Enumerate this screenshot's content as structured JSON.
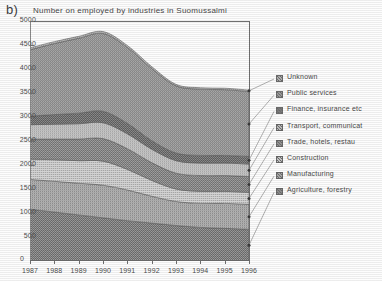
{
  "panel": {
    "label": "b)"
  },
  "chart_data": {
    "type": "area",
    "stacked": true,
    "title": "Number on employed by industries in Suomussalmi",
    "xlabel": "",
    "ylabel": "",
    "x": [
      1987,
      1988,
      1989,
      1990,
      1991,
      1992,
      1993,
      1994,
      1995,
      1996
    ],
    "categories": [
      "1987",
      "1988",
      "1989",
      "1990",
      "1991",
      "1992",
      "1993",
      "1994",
      "1995",
      "1996"
    ],
    "xlim": [
      1987,
      1996
    ],
    "ylim": [
      0,
      5000
    ],
    "yticks": [
      0,
      500,
      1000,
      1500,
      2000,
      2500,
      3000,
      3500,
      4000,
      4500,
      5000
    ],
    "ytick_labels": [
      "0",
      "500",
      "1000",
      "1500",
      "2000",
      "2500",
      "3000",
      "3500",
      "4000",
      "4500",
      "5000"
    ],
    "grid": false,
    "legend_position": "right",
    "series": [
      {
        "name": "Agriculture, forestry",
        "color": "#8e8e8e",
        "values": [
          1080,
          1020,
          960,
          900,
          840,
          790,
          740,
          700,
          680,
          660
        ]
      },
      {
        "name": "Manufacturing",
        "color": "#a8a8a8",
        "values": [
          620,
          640,
          660,
          680,
          640,
          560,
          500,
          500,
          520,
          520
        ]
      },
      {
        "name": "Construction",
        "color": "#c6c6c6",
        "values": [
          420,
          450,
          470,
          500,
          430,
          330,
          260,
          250,
          250,
          250
        ]
      },
      {
        "name": "Trade, hotels, restau",
        "color": "#959595",
        "values": [
          420,
          430,
          450,
          470,
          430,
          370,
          330,
          330,
          330,
          330
        ]
      },
      {
        "name": "Transport, communicat",
        "color": "#bdbdbd",
        "values": [
          300,
          310,
          320,
          330,
          310,
          280,
          260,
          260,
          260,
          260
        ]
      },
      {
        "name": "Finance, insurance etc",
        "color": "#7d7d7d",
        "values": [
          180,
          200,
          220,
          240,
          220,
          180,
          160,
          160,
          160,
          160
        ]
      },
      {
        "name": "Public services",
        "color": "#9c9c9c",
        "values": [
          1380,
          1480,
          1560,
          1620,
          1580,
          1500,
          1400,
          1380,
          1370,
          1350
        ]
      },
      {
        "name": "Unknown",
        "color": "#b2b2b2",
        "values": [
          40,
          40,
          40,
          40,
          40,
          40,
          30,
          30,
          30,
          30
        ]
      }
    ],
    "legend_entries": [
      "Unknown",
      "Public services",
      "Finance, insurance etc",
      "Transport, communicat",
      "Trade, hotels, restau",
      "Construction",
      "Manufacturing",
      "Agriculture, forestry"
    ],
    "totals": [
      4440,
      4570,
      4680,
      4780,
      4490,
      4050,
      3680,
      3610,
      3600,
      3560
    ]
  }
}
